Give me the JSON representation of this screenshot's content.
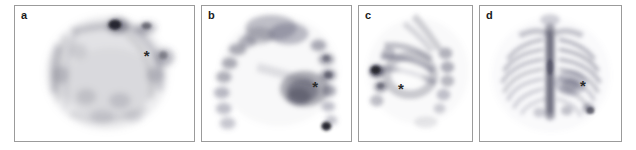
{
  "figure": {
    "caption_marker": "*",
    "background_color": "#ffffff",
    "border_color": "#9b9b9b",
    "ink_color": "#4a4a58",
    "panels": [
      {
        "id": "panel-a",
        "label": "a",
        "view_name": "transaxial-spect-slice",
        "x": 14,
        "width": 181,
        "marker": {
          "symbol": "*",
          "x_pct": 73.5,
          "y_pct": 36.5
        }
      },
      {
        "id": "panel-b",
        "label": "b",
        "view_name": "sagittal-spect-slice",
        "x": 201,
        "width": 151,
        "marker": {
          "symbol": "*",
          "x_pct": 76.0,
          "y_pct": 59.0
        }
      },
      {
        "id": "panel-c",
        "label": "c",
        "view_name": "coronal-oblique-spect-slice",
        "x": 358,
        "width": 115,
        "marker": {
          "symbol": "*",
          "x_pct": 37.0,
          "y_pct": 60.5
        }
      },
      {
        "id": "panel-d",
        "label": "d",
        "view_name": "anterior-planar-bone-scan",
        "x": 479,
        "width": 143,
        "marker": {
          "symbol": "*",
          "x_pct": 73.0,
          "y_pct": 58.5
        }
      }
    ]
  }
}
